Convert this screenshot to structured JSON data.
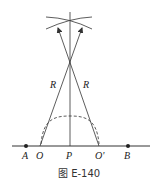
{
  "figure": {
    "caption": "图 E-140",
    "points": {
      "A": "A",
      "O": "O",
      "P": "P",
      "O_prime": "O'",
      "B": "B"
    },
    "radius_labels": [
      "R",
      "R"
    ]
  },
  "colors": {
    "line": "#333333",
    "background": "#ffffff"
  }
}
